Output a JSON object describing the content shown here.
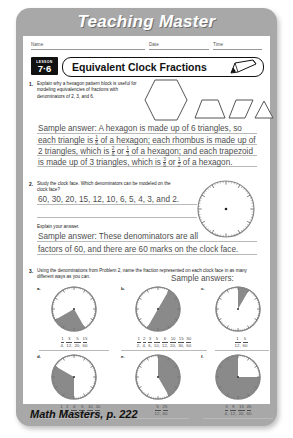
{
  "banner": {
    "title": "Teaching Master"
  },
  "header": {
    "name_label": "Name",
    "date_label": "Date",
    "time_label": "Time",
    "lesson_word": "LESSON",
    "lesson_number": "7·6",
    "title": "Equivalent Clock Fractions",
    "pencil_icon": "pencil-icon"
  },
  "problems": [
    {
      "number": "1.",
      "prompt": "Explain why a hexagon pattern block is useful for modeling equivalencies of fractions with denominators of 2, 3, and 6.",
      "shapes": [
        "hexagon",
        "trapezoid",
        "rhombus",
        "triangle"
      ],
      "answer_line1_a": "Sample answer: A hexagon is made up of 6 triangles, so",
      "answer_line2_a": "each triangle is",
      "answer_line2_f": {
        "n": "1",
        "d": "6"
      },
      "answer_line2_b": "of a hexagon; each rhombus is made up of",
      "answer_line3_a": "2 triangles, which is",
      "answer_line3_f1": {
        "n": "2",
        "d": "6"
      },
      "answer_line3_mid": "or",
      "answer_line3_f2": {
        "n": "1",
        "d": "3"
      },
      "answer_line3_b": "of a hexagon; and each trapezoid",
      "answer_line4_a": "is made up of 3 triangles, which is",
      "answer_line4_f1": {
        "n": "3",
        "d": "6"
      },
      "answer_line4_mid": "or",
      "answer_line4_f2": {
        "n": "1",
        "d": "2"
      },
      "answer_line4_b": "of a hexagon."
    },
    {
      "number": "2.",
      "prompt": "Study the clock face. Which denominators can be modeled on the clock face?",
      "answer": "60, 30, 20, 15, 12, 10, 6, 5, 4, 3, and 2.",
      "explain_label": "Explain your answer.",
      "explain_line1": "Sample answer: These denominators are all",
      "explain_line2": "factors of 60, and there are 60 marks on the clock face."
    },
    {
      "number": "3.",
      "prompt": "Using the denominations from Problem 2, name the fraction represented on each clock face in as many different ways as you can.",
      "sample_label": "Sample answers:"
    }
  ],
  "clocks": [
    {
      "label": "a.",
      "shaded_start_deg": 150,
      "shaded_end_deg": 240,
      "fractions": [
        {
          "n": "1",
          "d": "4"
        },
        {
          "n": "3",
          "d": "12"
        },
        {
          "n": "5",
          "d": "20"
        },
        {
          "n": "15",
          "d": "60"
        }
      ]
    },
    {
      "label": "b.",
      "shaded_start_deg": 30,
      "shaded_end_deg": 210,
      "fractions": [
        {
          "n": "1",
          "d": "2"
        },
        {
          "n": "2",
          "d": "4"
        },
        {
          "n": "3",
          "d": "6"
        },
        {
          "n": "5",
          "d": "10"
        },
        {
          "n": "6",
          "d": "12"
        },
        {
          "n": "10",
          "d": "20"
        },
        {
          "n": "15",
          "d": "30"
        },
        {
          "n": "30",
          "d": "60"
        }
      ]
    },
    {
      "label": "c.",
      "shaded_start_deg": 0,
      "shaded_end_deg": 30,
      "fractions": [
        {
          "n": "1",
          "d": "12"
        },
        {
          "n": "5",
          "d": "60"
        }
      ]
    },
    {
      "label": "d.",
      "shaded_start_deg": 180,
      "shaded_end_deg": 300,
      "fractions": [
        {
          "n": "1",
          "d": "3"
        },
        {
          "n": "2",
          "d": "6"
        },
        {
          "n": "4",
          "d": "12"
        },
        {
          "n": "5",
          "d": "15"
        },
        {
          "n": "10",
          "d": "30"
        },
        {
          "n": "20",
          "d": "60"
        }
      ]
    },
    {
      "label": "e.",
      "shaded_start_deg": 0,
      "shaded_end_deg": 150,
      "fractions": [
        {
          "n": "5",
          "d": "12"
        },
        {
          "n": "25",
          "d": "60"
        }
      ]
    },
    {
      "label": "f.",
      "shaded_start_deg": 90,
      "shaded_end_deg": 360,
      "fractions": [
        {
          "n": "3",
          "d": "4"
        },
        {
          "n": "9",
          "d": "12"
        },
        {
          "n": "15",
          "d": "20"
        },
        {
          "n": "45",
          "d": "60"
        }
      ]
    }
  ],
  "footer": {
    "text": "Math Masters, p. 222"
  },
  "colors": {
    "card": "#a8a8a8",
    "shade": "#8a8a8a",
    "ink": "#111111",
    "answer_ink": "#4e4e4e",
    "rule": "#b9b9b9"
  }
}
